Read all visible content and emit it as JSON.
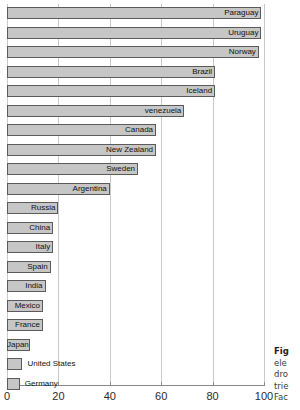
{
  "chart_data": {
    "type": "bar",
    "orientation": "horizontal",
    "title": "",
    "xlabel": "",
    "ylabel": "",
    "xlim": [
      0,
      100
    ],
    "xticks": [
      0,
      20,
      40,
      60,
      80,
      100
    ],
    "grid": true,
    "legend": "none",
    "bar_color": "#c6c6c6",
    "bar_edge_color": "#5b5b5b",
    "gridline_color": "#c9c9c9",
    "categories": [
      "Paraguay",
      "Uruguay",
      "Norway",
      "Brazil",
      "Iceland",
      "venezuela",
      "Canada",
      "New Zealand",
      "Sweden",
      "Argentina",
      "Russia",
      "China",
      "Italy",
      "Spain",
      "India",
      "Mexico",
      "France",
      "Japan",
      "United States",
      "Germany"
    ],
    "values": [
      99,
      99,
      98,
      81,
      81,
      69,
      58,
      58,
      51,
      40,
      20,
      18,
      18,
      17,
      15,
      14,
      14,
      9,
      6,
      5
    ],
    "label_placement": [
      "inside",
      "inside",
      "inside",
      "inside",
      "inside",
      "inside",
      "inside",
      "inside",
      "inside",
      "inside",
      "inside",
      "inside",
      "inside",
      "inside",
      "inside",
      "inside",
      "inside",
      "inside",
      "outside",
      "outside"
    ]
  },
  "caption": {
    "line1": "Fig",
    "line2": "ele",
    "line3": "dro",
    "line4": "trie",
    "line5": "Fac"
  }
}
